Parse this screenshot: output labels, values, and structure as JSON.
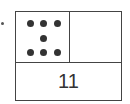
{
  "diagram": {
    "type": "ten-frame-number-bond",
    "dot_count": 7,
    "dots": [
      {
        "x": 11,
        "y": 8
      },
      {
        "x": 24,
        "y": 8
      },
      {
        "x": 38,
        "y": 8
      },
      {
        "x": 24,
        "y": 23
      },
      {
        "x": 11,
        "y": 37
      },
      {
        "x": 24,
        "y": 37
      },
      {
        "x": 38,
        "y": 37
      }
    ],
    "empty_cell_value": "",
    "total_label": "11"
  }
}
